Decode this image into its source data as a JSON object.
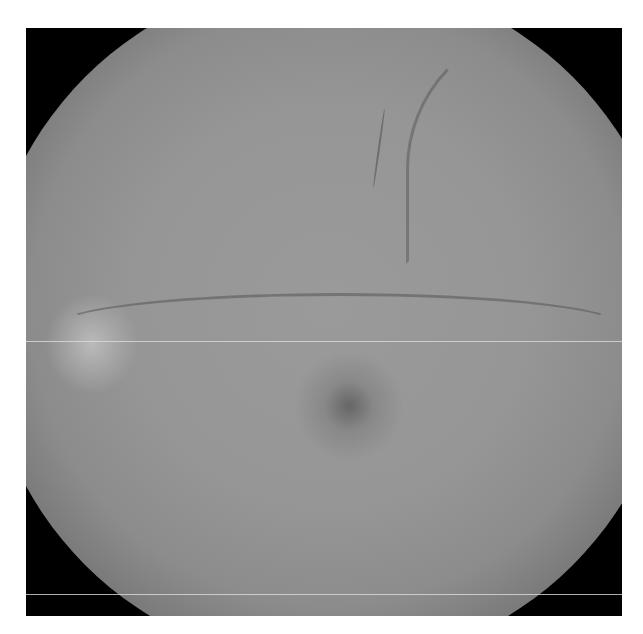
{
  "image": {
    "subject": "retinal fundus photograph (grayscale)",
    "features": [
      "optic-disc",
      "macula",
      "retinal-vessels",
      "circular-vignette",
      "horizontal-scan-lines"
    ],
    "colors": {
      "background": "#ffffff",
      "retina_base": "#969696",
      "vignette": "#000000",
      "optic_disc": "#c8c8c8",
      "macula": "#5a5a5a"
    }
  }
}
